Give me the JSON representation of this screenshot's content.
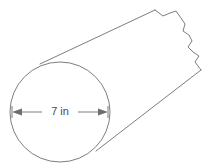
{
  "figure": {
    "name": "cylinder-with-diameter-label",
    "background_color": "#ffffff",
    "stroke_color": "#6e6e6e",
    "text_color": "#4a4a4a"
  },
  "dimension": {
    "label": "7 in",
    "value": 7,
    "unit": "in",
    "measures": "diameter",
    "line_y": 112,
    "line_x_start": 12,
    "line_x_end": 108
  },
  "circle": {
    "center_x": 60,
    "center_y": 112,
    "radius_x": 50,
    "radius_y": 50
  },
  "edges": {
    "top": "M 40 64 L 155 10",
    "bottom": "M 96 151 L 201 70"
  },
  "torn_edge": {
    "points": "155 10 163 16 170 13 176 11 181 18 185 24 183 31 189 35 192 41 188 47 193 52 199 56 195 62 201 70"
  }
}
